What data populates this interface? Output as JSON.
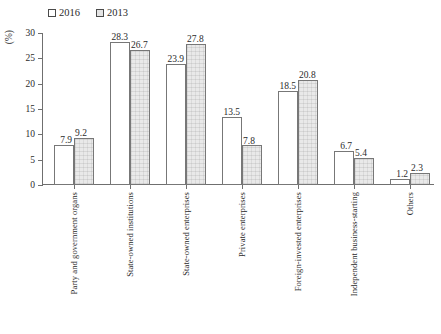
{
  "chart_data": {
    "type": "bar",
    "title": "",
    "xlabel": "",
    "ylabel": "(%)",
    "ylim": [
      0,
      30
    ],
    "yticks": [
      0,
      5,
      10,
      15,
      20,
      25,
      30
    ],
    "grid": false,
    "legend_position": "top-left",
    "categories": [
      "Party and government organs",
      "State-owned institutions",
      "State-owned enterprises",
      "Private enterprises",
      "Foreign-invested enterprises",
      "Independent business-starting",
      "Others"
    ],
    "series": [
      {
        "name": "2016",
        "color": "#ffffff",
        "values": [
          7.9,
          28.3,
          23.9,
          13.5,
          18.5,
          6.7,
          1.2
        ]
      },
      {
        "name": "2013",
        "color": "#e9e9e9",
        "values": [
          9.2,
          26.7,
          27.8,
          7.8,
          20.8,
          5.4,
          2.3
        ]
      }
    ]
  },
  "legend": {
    "entries": [
      {
        "label": "2016",
        "swatch": "empty-square"
      },
      {
        "label": "2013",
        "swatch": "gray-square"
      }
    ]
  },
  "axis": {
    "y_title": "(%)",
    "tick_labels": [
      "0",
      "5",
      "10",
      "15",
      "20",
      "25",
      "30"
    ]
  }
}
